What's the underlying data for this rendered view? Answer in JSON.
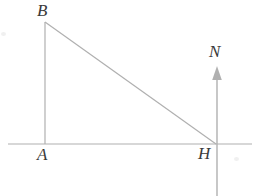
{
  "figure": {
    "background_color": "#ffffff",
    "line_color": "#b0b0b0",
    "label_color": "#3a3a3a",
    "width": 259,
    "height": 196
  },
  "labels": {
    "b": "B",
    "a": "A",
    "h": "H",
    "n": "N"
  },
  "chart_data": {
    "type": "diagram",
    "points": [
      {
        "name": "B",
        "x": 45,
        "y": 22,
        "label": "B"
      },
      {
        "name": "A",
        "x": 45,
        "y": 144,
        "label": "A"
      },
      {
        "name": "H",
        "x": 216,
        "y": 144,
        "label": "H"
      },
      {
        "name": "N",
        "x": 217,
        "y": 66,
        "label": "N"
      }
    ],
    "segments": [
      {
        "name": "baseline",
        "from": [
          8,
          144
        ],
        "to": [
          252,
          144
        ]
      },
      {
        "name": "AB",
        "from": [
          45,
          22
        ],
        "to": [
          45,
          144
        ]
      },
      {
        "name": "BH",
        "from": [
          45,
          22
        ],
        "to": [
          216,
          144
        ]
      },
      {
        "name": "HN-ray",
        "from": [
          217,
          196
        ],
        "to": [
          217,
          66
        ]
      }
    ],
    "arrows": [
      {
        "name": "N-arrowhead",
        "tip": [
          217,
          66
        ],
        "direction": "up"
      }
    ],
    "grid": false,
    "legend": null
  }
}
